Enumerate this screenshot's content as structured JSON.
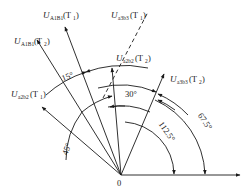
{
  "diagram": {
    "origin_label": "0",
    "vectors": [
      {
        "id": "Ua3b3_T2",
        "symbol": "U",
        "subscript": "a3b3",
        "paren": "(T",
        "paren_sub": "2",
        "paren_close": ")"
      },
      {
        "id": "Ua2b2_T2",
        "symbol": "U",
        "subscript": "a2b2",
        "paren": "(T",
        "paren_sub": "2",
        "paren_close": ")"
      },
      {
        "id": "Ua3b3_T1",
        "symbol": "U",
        "subscript": "a3b3",
        "paren": "(T",
        "paren_sub": "1",
        "paren_close": ")"
      },
      {
        "id": "UA1B1_T1",
        "symbol": "U",
        "subscript": "A1B1",
        "paren": "(T",
        "paren_sub": "1",
        "paren_close": ")"
      },
      {
        "id": "UA1B1_T2",
        "symbol": "U",
        "subscript": "A1B1",
        "paren": "(T",
        "paren_sub": "2",
        "paren_close": ")"
      },
      {
        "id": "Ua2b2_T1",
        "symbol": "U",
        "subscript": "a2b2",
        "paren": "(T",
        "paren_sub": "1",
        "paren_close": ")"
      }
    ],
    "angles": [
      {
        "id": "a15",
        "label": "15°"
      },
      {
        "id": "a30",
        "label": "30°"
      },
      {
        "id": "a45",
        "label": "45°"
      },
      {
        "id": "a112",
        "label": "112.5°"
      },
      {
        "id": "a67",
        "label": "67.5°"
      }
    ]
  }
}
